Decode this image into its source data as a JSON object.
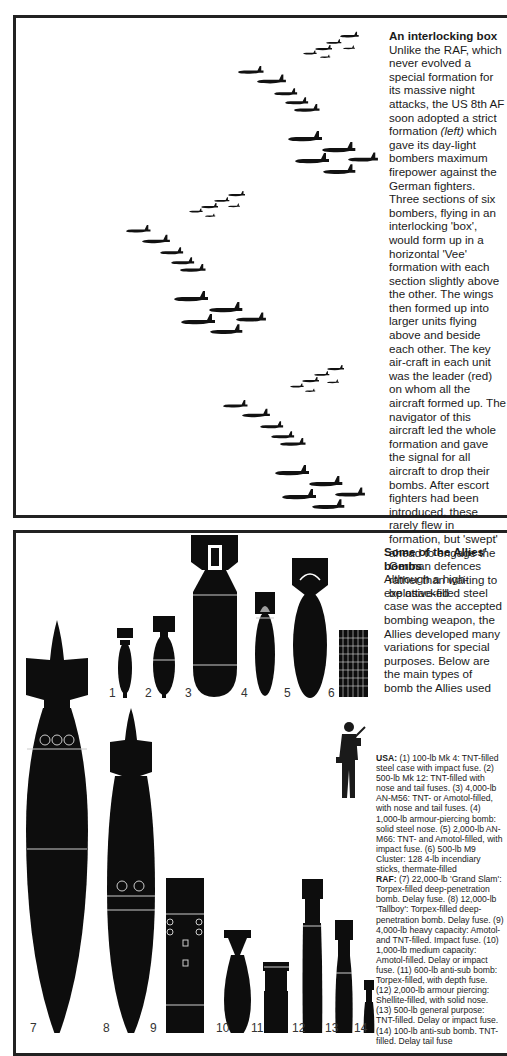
{
  "formation_panel": {
    "title": "An interlocking box",
    "body_part1": "Unlike the RAF, which never evolved a special formation for its massive night attacks, the US 8th AF soon adopted a strict formation ",
    "body_italic": "(left)",
    "body_part2": " which gave its day-light bombers maximum firepower against the German fighters. Three sections of six bombers, flying in an interlocking 'box', would form up in a horizontal 'Vee' formation with each section slightly above the other. The wings then formed up into larger units flying above and beside each other. The key air-craft in each unit was the leader (red) on whom all the aircraft formed up. The navigator of this aircraft led the whole formation and gave the signal for all aircraft to drop their bombs. After escort fighters had been introduced, these rarely flew in formation, but 'swept' ahead to engage the German defences rather than waiting to be attacked",
    "illustration": "b17-bomber-formation-silhouettes"
  },
  "bombs_panel": {
    "title": "Some of the Allies' bombs",
    "intro": "Although a high-explosive-filled steel case was the accepted bombing weapon, the Allies developed many variations for special purposes. Below are the main types of bomb the Allies used",
    "bomb_numbers": [
      "1",
      "2",
      "3",
      "4",
      "5",
      "6",
      "7",
      "8",
      "9",
      "10",
      "11",
      "12",
      "13",
      "14"
    ],
    "usa_label": "USA:",
    "usa_text": " (1) 100-lb Mk 4: TNT-filled steel case with impact fuse. (2) 500-lb Mk 12: TNT-filled with nose and tail fuses. (3) 4,000-lb AN-M56: TNT- or Amotol-filled, with nose and tail fuses. (4) 1,000-lb armour-piercing bomb: solid steel nose. (5) 2,000-lb AN-M66: TNT- and Amotol-filled, with impact fuse. (6) 500-lb M9 Cluster: 128 4-lb incendiary sticks, thermate-filled",
    "raf_label": "RAF:",
    "raf_text": " (7) 22,000-lb 'Grand Slam': Torpex-filled deep-penetration bomb. Delay fuse. (8) 12,000-lb 'Tallboy': Torpex-filled deep-penetration bomb. Delay fuse. (9) 4,000-lb heavy capacity: Amotol- and TNT-filled. Impact fuse. (10) 1,000-lb medium capacity: Amotol-filled. Delay or impact fuse. (11) 600-lb anti-sub bomb: Torpex-filled, with depth fuse. (12) 2,000-lb armour piercing: Shellite-filled, with solid nose. (13) 500-lb general purpose: TNT-filled. Delay or impact fuse. (14) 100-lb anti-sub bomb. TNT-filled. Delay tail fuse",
    "scale_figure": "soldier-silhouette-for-scale"
  }
}
